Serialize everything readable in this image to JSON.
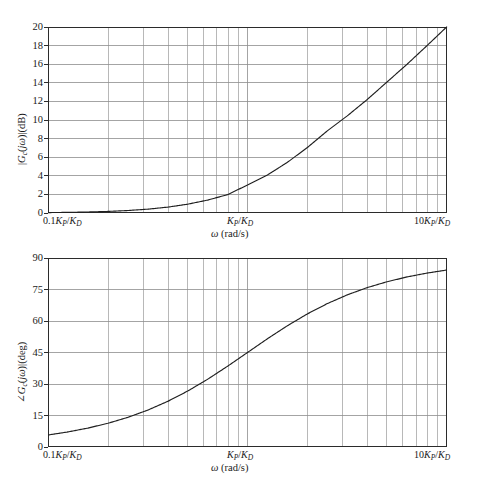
{
  "figure": {
    "name": "bode-plot-pd-controller",
    "background_color": "#ffffff",
    "line_color": "#1f1f1f",
    "grid_color": "#8d8d8d",
    "axis_color": "#2b2b2b"
  },
  "chart_data": [
    {
      "type": "line",
      "name": "magnitude-plot",
      "title": "",
      "xlabel": "ω (rad/s)",
      "ylabel": "|G_c(jω)|(dB)",
      "xscale": "log",
      "xlim": [
        0.1,
        10
      ],
      "ylim": [
        0,
        20
      ],
      "yticks": [
        0,
        2,
        4,
        6,
        8,
        10,
        12,
        14,
        16,
        18,
        20
      ],
      "ytick_labels": [
        "0",
        "2",
        "4",
        "6",
        "8",
        "10",
        "12",
        "14",
        "16",
        "18",
        "20"
      ],
      "xtick_labels": [
        "0.1K_P/K_D",
        "K_P/K_D",
        "10K_P/K_D"
      ],
      "xtick_values": [
        0.1,
        1,
        10
      ],
      "grid": true,
      "legend": "none",
      "series": [
        {
          "name": "|Gc(jw)| dB = 20*log10(sqrt(1+w^2))",
          "x": [
            0.1,
            0.125,
            0.158,
            0.2,
            0.251,
            0.316,
            0.398,
            0.501,
            0.631,
            0.794,
            1.0,
            1.259,
            1.585,
            1.995,
            2.512,
            3.162,
            3.981,
            5.012,
            6.31,
            7.943,
            10.0
          ],
          "values": [
            0.043,
            0.067,
            0.107,
            0.17,
            0.266,
            0.412,
            0.63,
            0.946,
            1.388,
            1.973,
            3.01,
            4.09,
            5.45,
            7.04,
            8.83,
            10.44,
            12.2,
            14.1,
            16.0,
            18.0,
            20.04
          ]
        }
      ]
    },
    {
      "type": "line",
      "name": "phase-plot",
      "title": "",
      "xlabel": "ω (rad/s)",
      "ylabel": "∠G_c(jω)|(deg)",
      "xscale": "log",
      "xlim": [
        0.1,
        10
      ],
      "ylim": [
        0,
        90
      ],
      "yticks": [
        0,
        15,
        30,
        45,
        60,
        75,
        90
      ],
      "ytick_labels": [
        "0",
        "15",
        "30",
        "45",
        "60",
        "75",
        "90"
      ],
      "xtick_labels": [
        "0.1K_P/K_D",
        "K_P/K_D",
        "10K_P/K_D"
      ],
      "xtick_values": [
        0.1,
        1,
        10
      ],
      "grid": true,
      "legend": "none",
      "series": [
        {
          "name": "angle Gc(jw) deg = atan(w)",
          "x": [
            0.1,
            0.125,
            0.158,
            0.2,
            0.251,
            0.316,
            0.398,
            0.501,
            0.631,
            0.794,
            1.0,
            1.259,
            1.585,
            1.995,
            2.512,
            3.162,
            3.981,
            5.012,
            6.31,
            7.943,
            10.0
          ],
          "values": [
            5.71,
            7.13,
            8.98,
            11.31,
            14.1,
            17.55,
            21.71,
            26.62,
            32.25,
            38.45,
            45.0,
            51.55,
            57.75,
            63.38,
            68.29,
            72.45,
            75.9,
            78.71,
            80.99,
            82.82,
            84.29
          ]
        }
      ]
    }
  ],
  "magnitude_panel": {
    "y_axis_title_parts": {
      "pre": "|G",
      "sub": "c",
      "post": "(jω)|(dB)"
    },
    "y_axis_title": "|Gc(jω)|(dB)",
    "y_tick_labels": [
      "20",
      "18",
      "16",
      "14",
      "12",
      "10",
      "8",
      "6",
      "4",
      "2",
      "0"
    ],
    "x_tick_left": "0.1K_P/K_D",
    "x_tick_center": "K_P/K_D",
    "x_tick_right": "10K_P/K_D",
    "x_axis_title": "ω (rad/s)"
  },
  "phase_panel": {
    "y_axis_title_parts": {
      "pre": "∠G",
      "sub": "c",
      "post": "(jω)|(deg)"
    },
    "y_axis_title": "∠Gc(jω)|(deg)",
    "y_tick_labels": [
      "90",
      "75",
      "60",
      "45",
      "30",
      "15",
      "0"
    ],
    "x_tick_left": "0.1K_P/K_D",
    "x_tick_center": "K_P/K_D",
    "x_tick_right": "10K_P/K_D",
    "x_axis_title": "ω (rad/s)"
  }
}
